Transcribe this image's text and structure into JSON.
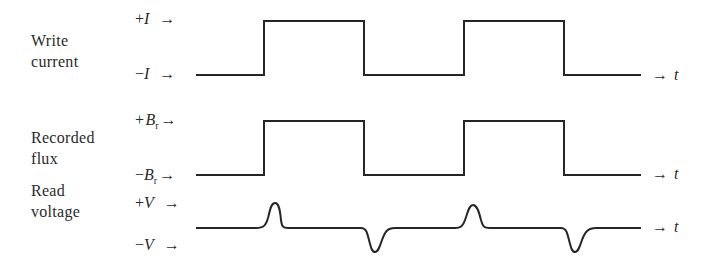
{
  "rows": [
    {
      "id": "write-current",
      "label_lines": [
        "Write",
        "current"
      ],
      "high": {
        "sign": "+",
        "symbol": "I",
        "sub": "",
        "arrow": "→"
      },
      "low": {
        "sign": "−",
        "symbol": "I",
        "sub": "",
        "arrow": "→"
      },
      "axis": {
        "arrow": "→",
        "symbol": "t"
      },
      "waveform": "square",
      "levels_px": {
        "high": 21,
        "low": 75
      }
    },
    {
      "id": "recorded-flux",
      "label_lines": [
        "Recorded",
        "flux"
      ],
      "high": {
        "sign": "+",
        "symbol": "B",
        "sub": "r",
        "arrow": "→"
      },
      "low": {
        "sign": "−",
        "symbol": "B",
        "sub": "r",
        "arrow": "→"
      },
      "axis": {
        "arrow": "→",
        "symbol": "t"
      },
      "waveform": "square",
      "levels_px": {
        "high": 121,
        "low": 175
      }
    },
    {
      "id": "read-voltage",
      "label_lines": [
        "Read",
        "voltage"
      ],
      "high": {
        "sign": "+",
        "symbol": "V",
        "sub": "",
        "arrow": "→"
      },
      "low": {
        "sign": "−",
        "symbol": "V",
        "sub": "",
        "arrow": "→"
      },
      "axis": {
        "arrow": "→",
        "symbol": "t"
      },
      "waveform": "pulses",
      "levels_px": {
        "baseline": 228,
        "peak": 203,
        "trough": 252
      }
    }
  ],
  "transitions_px": {
    "start": 196,
    "rise_1": 264,
    "fall_1": 364,
    "rise_2": 464,
    "fall_2": 564,
    "end": 641
  },
  "pulse_polarity_sequence": [
    "+",
    "−",
    "+",
    "−"
  ],
  "colors": {
    "stroke": "#262626",
    "text": "#2a2a2a",
    "background": "#ffffff"
  }
}
